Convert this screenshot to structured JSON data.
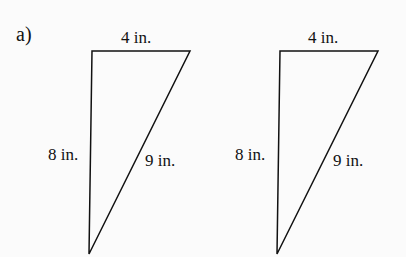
{
  "problem_label": "a)",
  "triangles": [
    {
      "top": "4 in.",
      "left": "8 in.",
      "hyp": "9 in."
    },
    {
      "top": "4 in.",
      "left": "8 in.",
      "hyp": "9 in."
    }
  ]
}
